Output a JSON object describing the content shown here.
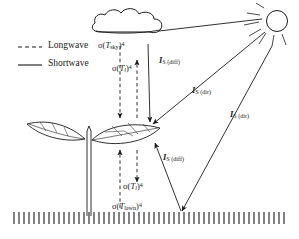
{
  "figure": {
    "background_color": "#ffffff",
    "stroke_color": "#1a1a1a",
    "width": 299,
    "height": 239
  },
  "legend": {
    "items": [
      {
        "label": "Longwave",
        "style": "dashed",
        "line_name": "legend-dashed-line"
      },
      {
        "label": "Shortwave",
        "style": "solid",
        "line_name": "legend-solid-line"
      }
    ]
  },
  "objects": [
    {
      "name": "sun",
      "label": "sun"
    },
    {
      "name": "cloud",
      "label": "cloud"
    },
    {
      "name": "plant",
      "label": "plant with two leaves"
    },
    {
      "name": "ground",
      "label": "lawn hatching"
    }
  ],
  "flux_labels": [
    {
      "id": "sigma-t-sky",
      "sigma": "σ",
      "open": "(",
      "var": "T",
      "subscript": "sky",
      "close": ")",
      "exponent": "4",
      "type": "longwave",
      "description": "sky longwave emission"
    },
    {
      "id": "sigma-t-l-upper",
      "sigma": "σ",
      "open": "(",
      "var": "T",
      "subscript": "l",
      "close": ")",
      "exponent": "4",
      "type": "longwave",
      "description": "leaf longwave emission upward"
    },
    {
      "id": "sigma-t-l-lower",
      "sigma": "σ",
      "open": "(",
      "var": "T",
      "subscript": "l",
      "close": ")",
      "exponent": "4",
      "type": "longwave",
      "description": "leaf longwave emission downward"
    },
    {
      "id": "sigma-t-lawn",
      "sigma": "σ",
      "open": "(",
      "var": "T",
      "subscript": "lawn",
      "close": ")",
      "exponent": "4",
      "type": "longwave",
      "description": "lawn longwave emission upward"
    }
  ],
  "shortwave_labels": [
    {
      "id": "is-diff-upper",
      "symbol": "I",
      "subscript": "S (diff)",
      "description": "diffuse shortwave from cloud to leaf"
    },
    {
      "id": "is-dir-upper",
      "symbol": "I",
      "subscript": "S (dir)",
      "description": "direct shortwave from sun to leaf"
    },
    {
      "id": "is-dir-right",
      "symbol": "I",
      "subscript": "S (dir)",
      "description": "direct shortwave from sun to lawn"
    },
    {
      "id": "is-diff-lower",
      "symbol": "I",
      "subscript": "S (diff)",
      "description": "diffuse shortwave reflected from lawn to leaf underside"
    }
  ]
}
